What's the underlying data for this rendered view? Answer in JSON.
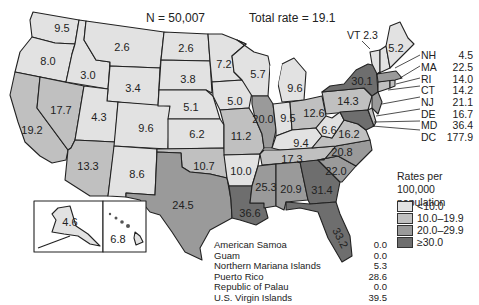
{
  "chart_data": {
    "type": "choropleth-map",
    "title": "N = 50,007",
    "subtitle": "Total rate = 19.1",
    "legend": {
      "title": "Rates per 100,000 population",
      "position": "right",
      "bins": [
        {
          "label": "<10.0",
          "color": "#e2e2e2"
        },
        {
          "label": "10.0–19.9",
          "color": "#c0c0c0"
        },
        {
          "label": "20.0–29.9",
          "color": "#9a9a9a"
        },
        {
          "label": "≥30.0",
          "color": "#6e6e6e"
        }
      ]
    },
    "states": {
      "WA": 9.5,
      "OR": 8.0,
      "CA": 19.2,
      "NV": 17.7,
      "ID": 3.0,
      "MT": 2.6,
      "WY": 3.4,
      "UT": 4.3,
      "AZ": 13.3,
      "CO": 9.6,
      "NM": 8.6,
      "ND": 2.6,
      "SD": 3.8,
      "NE": 5.1,
      "KS": 6.2,
      "OK": 10.7,
      "TX": 24.5,
      "MN": 7.2,
      "IA": 5.0,
      "MO": 11.2,
      "AR": 10.0,
      "LA": 36.6,
      "WI": 5.7,
      "IL": 20.0,
      "MI": 9.6,
      "IN": 9.5,
      "OH": 12.6,
      "KY": 9.4,
      "TN": 17.3,
      "MS": 25.3,
      "AL": 20.9,
      "GA": 31.4,
      "FL": 33.2,
      "SC": 22.0,
      "NC": 20.8,
      "VA": 16.2,
      "WV": 6.6,
      "PA": 14.3,
      "NY": 30.1,
      "ME": 5.2,
      "VT": 2.3,
      "NH": 4.5,
      "MA": 22.5,
      "RI": 14.0,
      "CT": 14.2,
      "NJ": 21.1,
      "DE": 16.7,
      "MD": 36.4,
      "DC": 177.9,
      "AK": 4.6,
      "HI": 6.8
    },
    "territories": [
      {
        "name": "American Samoa",
        "value": 0.0
      },
      {
        "name": "Guam",
        "value": 0.0
      },
      {
        "name": "Northern Mariana Islands",
        "value": 5.3
      },
      {
        "name": "Puerto Rico",
        "value": 28.6
      },
      {
        "name": "Republic of Palau",
        "value": 0.0
      },
      {
        "name": "U.S. Virgin Islands",
        "value": 39.5
      }
    ]
  },
  "header": {
    "n_label": "N = 50,007",
    "total_label": "Total rate = 19.1"
  },
  "map_labels": [
    {
      "s": "WA",
      "t": "9.5",
      "x": 62,
      "y": 28
    },
    {
      "s": "OR",
      "t": "8.0",
      "x": 48,
      "y": 61
    },
    {
      "s": "CA",
      "t": "19.2",
      "x": 32,
      "y": 130
    },
    {
      "s": "NV",
      "t": "17.7",
      "x": 61,
      "y": 110
    },
    {
      "s": "ID",
      "t": "3.0",
      "x": 88,
      "y": 75
    },
    {
      "s": "MT",
      "t": "2.6",
      "x": 122,
      "y": 47
    },
    {
      "s": "WY",
      "t": "3.4",
      "x": 133,
      "y": 88
    },
    {
      "s": "UT",
      "t": "4.3",
      "x": 99,
      "y": 117
    },
    {
      "s": "AZ",
      "t": "13.3",
      "x": 88,
      "y": 166
    },
    {
      "s": "CO",
      "t": "9.6",
      "x": 146,
      "y": 128
    },
    {
      "s": "NM",
      "t": "8.6",
      "x": 137,
      "y": 174
    },
    {
      "s": "ND",
      "t": "2.6",
      "x": 186,
      "y": 48
    },
    {
      "s": "SD",
      "t": "3.8",
      "x": 188,
      "y": 79
    },
    {
      "s": "NE",
      "t": "5.1",
      "x": 191,
      "y": 107
    },
    {
      "s": "KS",
      "t": "6.2",
      "x": 197,
      "y": 134
    },
    {
      "s": "OK",
      "t": "10.7",
      "x": 204,
      "y": 166
    },
    {
      "s": "TX",
      "t": "24.5",
      "x": 183,
      "y": 205
    },
    {
      "s": "MN",
      "t": "7.2",
      "x": 224,
      "y": 64
    },
    {
      "s": "IA",
      "t": "5.0",
      "x": 235,
      "y": 101
    },
    {
      "s": "MO",
      "t": "11.2",
      "x": 241,
      "y": 136
    },
    {
      "s": "AR",
      "t": "10.0",
      "x": 241,
      "y": 171
    },
    {
      "s": "LA",
      "t": "36.6",
      "x": 250,
      "y": 213
    },
    {
      "s": "WI",
      "t": "5.7",
      "x": 258,
      "y": 74
    },
    {
      "s": "IL",
      "t": "20.0",
      "x": 263,
      "y": 119
    },
    {
      "s": "MI",
      "t": "9.6",
      "x": 295,
      "y": 88
    },
    {
      "s": "IN",
      "t": "9.5",
      "x": 288,
      "y": 118
    },
    {
      "s": "OH",
      "t": "12.6",
      "x": 314,
      "y": 113
    },
    {
      "s": "KY",
      "t": "9.4",
      "x": 301,
      "y": 143
    },
    {
      "s": "TN",
      "t": "17.3",
      "x": 292,
      "y": 159
    },
    {
      "s": "MS",
      "t": "25.3",
      "x": 266,
      "y": 187
    },
    {
      "s": "AL",
      "t": "20.9",
      "x": 291,
      "y": 189
    },
    {
      "s": "GA",
      "t": "31.4",
      "x": 322,
      "y": 190
    },
    {
      "s": "SC",
      "t": "22.0",
      "x": 336,
      "y": 171
    },
    {
      "s": "NC",
      "t": "20.8",
      "x": 342,
      "y": 152
    },
    {
      "s": "VA",
      "t": "16.2",
      "x": 349,
      "y": 134
    },
    {
      "s": "WV",
      "t": "6.6",
      "x": 329,
      "y": 130
    },
    {
      "s": "PA",
      "t": "14.3",
      "x": 348,
      "y": 101
    },
    {
      "s": "NY",
      "t": "30.1",
      "x": 362,
      "y": 81
    },
    {
      "s": "ME",
      "t": "5.2",
      "x": 396,
      "y": 48
    },
    {
      "s": "AK",
      "t": "4.6",
      "x": 70,
      "y": 222
    },
    {
      "s": "HI",
      "t": "6.8",
      "x": 118,
      "y": 239
    }
  ],
  "vt_label": "VT  2.3",
  "ne_callouts": [
    {
      "code": "NH",
      "val": "4.5"
    },
    {
      "code": "MA",
      "val": "22.5"
    },
    {
      "code": "RI",
      "val": "14.0"
    },
    {
      "code": "CT",
      "val": "14.2"
    },
    {
      "code": "NJ",
      "val": "21.1"
    },
    {
      "code": "DE",
      "val": "16.7"
    },
    {
      "code": "MD",
      "val": "36.4"
    },
    {
      "code": "DC",
      "val": "177.9"
    }
  ],
  "legend": {
    "title": "Rates per 100,000 population",
    "items": [
      "<10.0",
      "10.0–19.9",
      "20.0–29.9",
      "≥30.0"
    ]
  },
  "territories": [
    {
      "name": "American Samoa",
      "value": "0.0"
    },
    {
      "name": "Guam",
      "value": "0.0"
    },
    {
      "name": "Northern Mariana Islands",
      "value": "5.3"
    },
    {
      "name": "Puerto Rico",
      "value": "28.6"
    },
    {
      "name": "Republic of Palau",
      "value": "0.0"
    },
    {
      "name": "U.S. Virgin Islands",
      "value": "39.5"
    }
  ]
}
